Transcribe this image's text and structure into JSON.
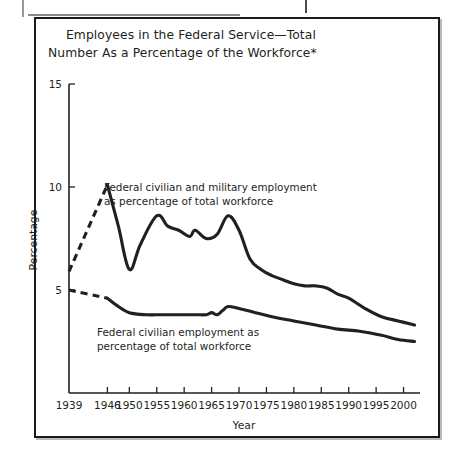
{
  "figure": {
    "title_line1": "Employees in the Federal Service—Total",
    "title_line2": "Number As a Percentage of the Workforce*"
  },
  "chart_data": {
    "type": "line",
    "title": "Employees in the Federal Service—Total Number As a Percentage of the Workforce*",
    "xlabel": "Year",
    "ylabel": "Percentage",
    "xlim": [
      1939,
      2003
    ],
    "ylim": [
      0,
      15
    ],
    "grid": false,
    "legend": "annotations-inline",
    "ytick_labels": [
      "15",
      "10",
      "5"
    ],
    "yticks": [
      15,
      10,
      5
    ],
    "xtick_labels": [
      "1939",
      "1946",
      "1950",
      "1955",
      "1960",
      "1965",
      "1970",
      "1975",
      "1980",
      "1985",
      "1990",
      "1995",
      "2000"
    ],
    "xticks": [
      1939,
      1946,
      1950,
      1955,
      1960,
      1965,
      1970,
      1975,
      1980,
      1985,
      1990,
      1995,
      2000
    ],
    "annotations": [
      {
        "id": "annotation-total",
        "line1": "Federal civilian and military employment",
        "line2": "as percentage of total workforce",
        "x": 1948.5,
        "y": 9.6
      },
      {
        "id": "annotation-civilian",
        "line1": "Federal civilian employment as",
        "line2": "percentage of total workforce",
        "x": 1947.5,
        "y": 3.2
      }
    ],
    "series": [
      {
        "name": "Federal civilian and military employment as percentage of total workforce",
        "style": "solid",
        "color": "#231f20",
        "x": [
          1946,
          1948,
          1950,
          1952,
          1955,
          1957,
          1959,
          1961,
          1962,
          1964,
          1966,
          1968,
          1970,
          1972,
          1974,
          1976,
          1978,
          1980,
          1982,
          1984,
          1986,
          1988,
          1990,
          1993,
          1996,
          1999,
          2002
        ],
        "values": [
          10.1,
          8.1,
          6.0,
          7.2,
          8.6,
          8.1,
          7.9,
          7.6,
          7.9,
          7.5,
          7.7,
          8.6,
          7.9,
          6.5,
          6.0,
          5.7,
          5.5,
          5.3,
          5.2,
          5.2,
          5.1,
          4.8,
          4.6,
          4.1,
          3.7,
          3.5,
          3.3
        ]
      },
      {
        "name": "Federal civilian and military employment as percentage of total workforce (projected segment)",
        "style": "dashed",
        "color": "#231f20",
        "x": [
          1939,
          1946
        ],
        "values": [
          5.9,
          10.1
        ]
      },
      {
        "name": "Federal civilian employment as percentage of total workforce",
        "style": "solid",
        "color": "#231f20",
        "x": [
          1946,
          1948,
          1950,
          1953,
          1956,
          1959,
          1962,
          1964,
          1965,
          1966,
          1967,
          1968,
          1970,
          1973,
          1976,
          1980,
          1984,
          1988,
          1992,
          1996,
          1999,
          2002
        ],
        "values": [
          4.6,
          4.2,
          3.9,
          3.8,
          3.8,
          3.8,
          3.8,
          3.8,
          3.9,
          3.8,
          4.0,
          4.2,
          4.1,
          3.9,
          3.7,
          3.5,
          3.3,
          3.1,
          3.0,
          2.8,
          2.6,
          2.5
        ]
      },
      {
        "name": "Federal civilian employment as percentage of total workforce (projected segment)",
        "style": "dashed",
        "color": "#231f20",
        "x": [
          1939,
          1946
        ],
        "values": [
          5.0,
          4.6
        ]
      }
    ]
  }
}
